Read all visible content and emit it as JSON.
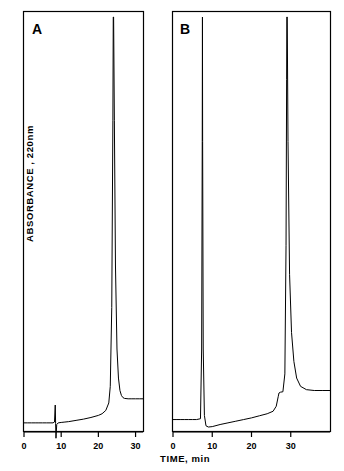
{
  "figure": {
    "y_axis_label": "ABSORBANCE , 220nm",
    "x_axis_label": "TIME, min",
    "panel_a_label": "A",
    "panel_b_label": "B",
    "stroke_color": "#000000",
    "background_color": "#ffffff"
  },
  "chart_data": [
    {
      "type": "line",
      "panel": "A",
      "title": "A",
      "xlabel": "TIME, min",
      "ylabel": "ABSORBANCE , 220nm",
      "xlim": [
        0,
        32
      ],
      "ylim": [
        0,
        100
      ],
      "xticks": [
        0,
        10,
        20,
        30
      ],
      "xticklabels": [
        "0",
        "10",
        "20",
        "30"
      ],
      "yticks": [],
      "grid": false,
      "legend": "none",
      "annotations": [
        "small sharp spike near 8.5 min",
        "large off-scale peak at 24 min running off top of frame",
        "peak tails back to elevated baseline after 26 min"
      ],
      "series": [
        {
          "name": "chromatogram A",
          "x": [
            0,
            1,
            2,
            3,
            4,
            5,
            6,
            7,
            7.8,
            8.2,
            8.4,
            8.5,
            8.6,
            8.8,
            9.2,
            10,
            11,
            12,
            14,
            16,
            18,
            20,
            21,
            22,
            22.8,
            23.2,
            23.6,
            23.9,
            24,
            24.1,
            24.3,
            24.6,
            25,
            25.4,
            25.8,
            26.2,
            26.6,
            27,
            28,
            29,
            30,
            31,
            32
          ],
          "y": [
            2.2,
            2.2,
            2.2,
            2.2,
            2.2,
            2.2,
            2.2,
            2.2,
            2.2,
            2.4,
            6.5,
            2.0,
            -1.5,
            1.8,
            2.2,
            2.3,
            2.4,
            2.5,
            2.8,
            3.1,
            3.5,
            4.0,
            4.4,
            5.2,
            7.0,
            11.0,
            30.0,
            75.0,
            100.0,
            100.0,
            75.0,
            40.0,
            20.0,
            13.0,
            10.0,
            8.8,
            8.3,
            8.1,
            8.0,
            8.0,
            8.0,
            8.0,
            8.0
          ]
        }
      ]
    },
    {
      "type": "line",
      "panel": "B",
      "title": "B",
      "xlabel": "TIME, min",
      "ylabel": "ABSORBANCE , 220nm",
      "xlim": [
        0,
        40
      ],
      "ylim": [
        0,
        100
      ],
      "xticks": [
        0,
        10,
        20,
        30
      ],
      "xticklabels": [
        "0",
        "10",
        "20",
        "30"
      ],
      "yticks": [],
      "grid": false,
      "legend": "none",
      "annotations": [
        "very narrow off-scale spike at 7.5 min reaching top of frame",
        "baseline step up near 27 min",
        "second large off-scale peak at 29 min",
        "broad tail descending to raised baseline after 31 min"
      ],
      "series": [
        {
          "name": "chromatogram B",
          "x": [
            0,
            1,
            2,
            3,
            4,
            5,
            6,
            7,
            7.3,
            7.45,
            7.5,
            7.55,
            7.7,
            8.0,
            8.4,
            9.0,
            10,
            12,
            14,
            16,
            18,
            20,
            22,
            24,
            25.5,
            26.3,
            26.8,
            27.0,
            27.4,
            28.0,
            28.5,
            28.8,
            28.95,
            29.0,
            29.1,
            29.3,
            29.7,
            30.2,
            30.8,
            31.5,
            32.5,
            34,
            36,
            38,
            40
          ],
          "y": [
            3.0,
            3.0,
            3.0,
            3.0,
            3.0,
            3.0,
            3.0,
            3.2,
            20.0,
            70.0,
            100.0,
            70.0,
            20.0,
            4.0,
            1.5,
            1.2,
            1.3,
            1.8,
            2.2,
            2.6,
            3.0,
            3.4,
            3.9,
            4.4,
            5.0,
            6.2,
            8.5,
            9.4,
            9.6,
            9.7,
            14.0,
            45.0,
            85.0,
            100.0,
            100.0,
            70.0,
            38.0,
            24.0,
            17.0,
            13.0,
            11.0,
            10.2,
            10.0,
            10.0,
            10.0
          ]
        }
      ]
    }
  ]
}
